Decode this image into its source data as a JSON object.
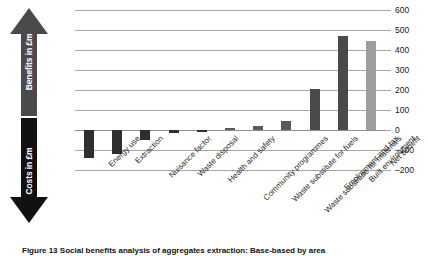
{
  "figure": {
    "caption": "Figure 13   Social benefits analysis of aggregates extraction: Base-based by area"
  },
  "axis_arrows": [
    {
      "name": "benefits",
      "label": "Benefits in £m",
      "direction": "up",
      "color": "#4a4a4a"
    },
    {
      "name": "costs",
      "label": "Costs in £m",
      "direction": "down",
      "color": "#111111"
    }
  ],
  "chart_data": {
    "type": "bar",
    "title": "",
    "subtitle": "",
    "xlabel": "",
    "ylabel": "£m",
    "ylim": [
      -200,
      600
    ],
    "yticks": [
      600,
      500,
      400,
      300,
      200,
      100,
      0,
      -100,
      -200
    ],
    "ytick_labels": [
      "600",
      "500",
      "400",
      "300",
      "200",
      "100",
      "0",
      "–100",
      "–200"
    ],
    "grid": true,
    "legend": "none",
    "axis_position": "right",
    "categories": [
      "Energy use",
      "Extraction",
      "Nuisance factor",
      "Waste disposal",
      "Health and safety",
      "Community programmes",
      "Waste substitute for fuels",
      "Waste substitute for materials",
      "Employment and tax",
      "Built environment",
      "Net benefit"
    ],
    "values": [
      -140,
      -120,
      -50,
      -15,
      -8,
      8,
      20,
      45,
      205,
      470,
      445
    ],
    "colors": [
      "#2f2f2f",
      "#2f2f2f",
      "#2f2f2f",
      "#2f2f2f",
      "#2f2f2f",
      "#5a5a5a",
      "#5a5a5a",
      "#5a5a5a",
      "#4a4a4a",
      "#4a4a4a",
      "#9d9d9d"
    ]
  }
}
